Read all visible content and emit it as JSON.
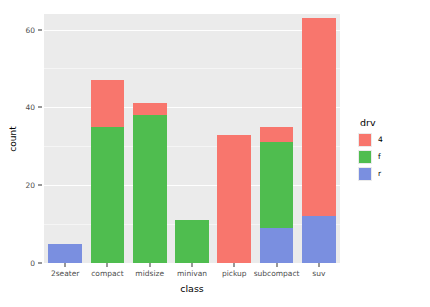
{
  "chart_data": {
    "type": "bar",
    "stacked": true,
    "title": "",
    "xlabel": "class",
    "ylabel": "count",
    "categories": [
      "2seater",
      "compact",
      "midsize",
      "minivan",
      "pickup",
      "subcompact",
      "suv"
    ],
    "series": [
      {
        "name": "4",
        "color": "#F8766D",
        "values": [
          0,
          12,
          3,
          0,
          33,
          4,
          51
        ]
      },
      {
        "name": "f",
        "color": "#4FBD4F",
        "values": [
          0,
          35,
          38,
          11,
          0,
          22,
          0
        ]
      },
      {
        "name": "r",
        "color": "#7A8FE0",
        "values": [
          5,
          0,
          0,
          0,
          0,
          9,
          12
        ]
      }
    ],
    "totals": [
      5,
      47,
      41,
      11,
      33,
      35,
      62
    ],
    "ylim": [
      0,
      64
    ],
    "yticks": [
      0,
      20,
      40,
      60
    ],
    "ytick_labels": [
      "0",
      "20",
      "40",
      "60"
    ],
    "yminor": [
      10,
      30,
      50
    ],
    "grid": true,
    "legend": {
      "title": "drv",
      "position": "right",
      "entries": [
        {
          "label": "4",
          "color": "#F8766D"
        },
        {
          "label": "f",
          "color": "#4FBD4F"
        },
        {
          "label": "r",
          "color": "#7A8FE0"
        }
      ]
    },
    "panel_background": "#EBEBEB",
    "grid_color": "#FFFFFF",
    "axis_text_color": "#4D4D4D"
  }
}
